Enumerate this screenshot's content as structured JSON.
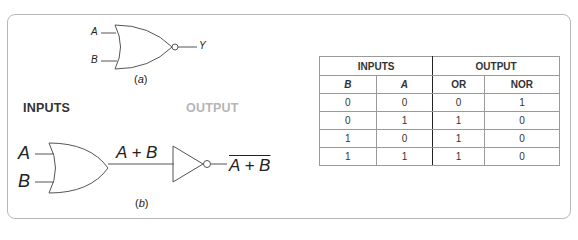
{
  "figure_a": {
    "input_a": "A",
    "input_b": "B",
    "output": "Y",
    "caption_open": "(",
    "caption_letter": "a",
    "caption_close": ")"
  },
  "figure_b": {
    "section_inputs": "INPUTS",
    "section_output": "OUTPUT",
    "input_a": "A",
    "input_b": "B",
    "intermediate_expr": "A + B",
    "output_expr": "A + B",
    "caption_open": "(",
    "caption_letter": "b",
    "caption_close": ")"
  },
  "truth_table": {
    "group_headers": [
      "INPUTS",
      "OUTPUT"
    ],
    "columns": [
      "B",
      "A",
      "OR",
      "NOR"
    ],
    "rows": [
      [
        "0",
        "0",
        "0",
        "1"
      ],
      [
        "0",
        "1",
        "1",
        "0"
      ],
      [
        "1",
        "0",
        "1",
        "0"
      ],
      [
        "1",
        "1",
        "1",
        "0"
      ]
    ]
  },
  "colors": {
    "frame_border": "#b8b8b8",
    "output_label": "#b5b5b5",
    "line": "#555555"
  }
}
